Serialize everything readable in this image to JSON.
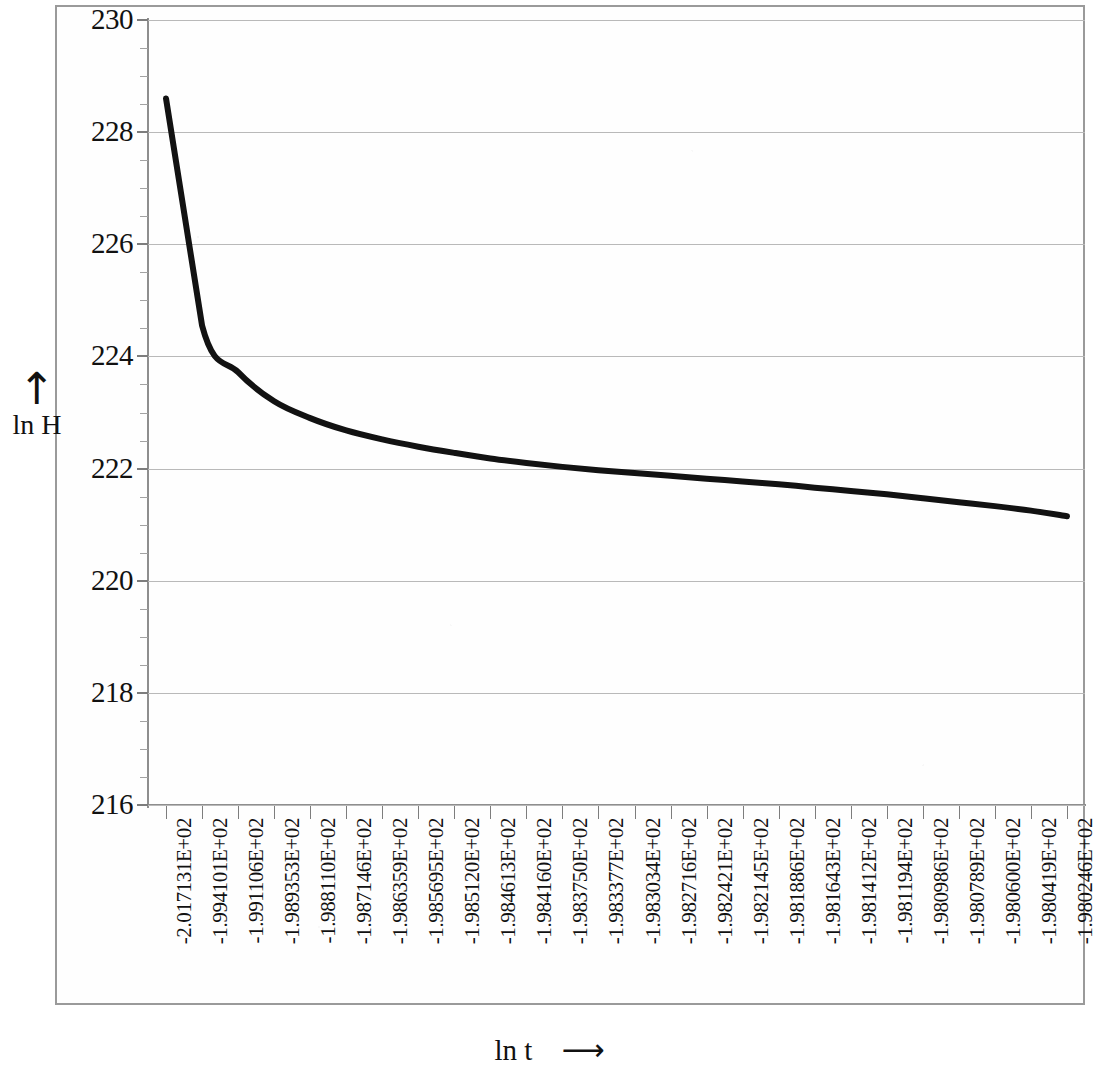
{
  "chart_data": {
    "type": "line",
    "title": "",
    "xlabel": "ln t",
    "ylabel": "ln H",
    "xlabel_arrow": "⟶",
    "ylabel_arrow": "↑",
    "ylim": [
      216,
      230
    ],
    "y_ticks": [
      216,
      218,
      220,
      222,
      224,
      226,
      228,
      230
    ],
    "y_tick_labels": [
      "216",
      "218",
      "220",
      "222",
      "224",
      "226",
      "228",
      "230"
    ],
    "y_minor_tick_step": 0.5,
    "grid": true,
    "grid_axis": "y",
    "legend": null,
    "categories": [
      "-2.017131E+02",
      "-1.994101E+02",
      "-1.991106E+02",
      "-1.989353E+02",
      "-1.988110E+02",
      "-1.987146E+02",
      "-1.986359E+02",
      "-1.985695E+02",
      "-1.985120E+02",
      "-1.984613E+02",
      "-1.984160E+02",
      "-1.983750E+02",
      "-1.983377E+02",
      "-1.983034E+02",
      "-1.982716E+02",
      "-1.982421E+02",
      "-1.982145E+02",
      "-1.981886E+02",
      "-1.981643E+02",
      "-1.981412E+02",
      "-1.981194E+02",
      "-1.980986E+02",
      "-1.980789E+02",
      "-1.980600E+02",
      "-1.980419E+02",
      "-1.980246E+02"
    ],
    "x": [
      -201.7131,
      -199.4101,
      -199.1106,
      -198.9353,
      -198.811,
      -198.7146,
      -198.6359,
      -198.5695,
      -198.512,
      -198.4613,
      -198.416,
      -198.375,
      -198.3377,
      -198.3034,
      -198.2716,
      -198.2421,
      -198.2145,
      -198.1886,
      -198.1643,
      -198.1412,
      -198.1194,
      -198.0986,
      -198.0789,
      -198.06,
      -198.0419,
      -198.0246
    ],
    "values": [
      228.6,
      224.55,
      223.72,
      223.2,
      222.9,
      222.68,
      222.52,
      222.39,
      222.28,
      222.18,
      222.1,
      222.03,
      221.97,
      221.92,
      221.87,
      221.82,
      221.77,
      221.72,
      221.66,
      221.6,
      221.54,
      221.47,
      221.4,
      221.33,
      221.25,
      221.15
    ],
    "series_name": "ln H",
    "line_color": "#121212",
    "line_width": 6,
    "grid_color": "#b9b9b9",
    "axis_color": "#8e8e8e",
    "frame_color": "#9a9a9a",
    "background_color": "#fefefe"
  }
}
